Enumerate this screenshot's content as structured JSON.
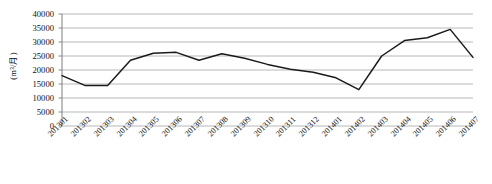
{
  "chart_data": {
    "type": "line",
    "title": "",
    "xlabel": "",
    "ylabel": "(m³/月)",
    "ylim": [
      0,
      40000
    ],
    "ytick_step": 5000,
    "grid": true,
    "legend": "none",
    "line_color": "#1a1a1a",
    "grid_color": "#a6a6a6",
    "axis_color": "#7f7f7f",
    "categories": [
      "201301",
      "201302",
      "201303",
      "201304",
      "201305",
      "201306",
      "201307",
      "201308",
      "201309",
      "201310",
      "201311",
      "201312",
      "201401",
      "201402",
      "201403",
      "201404",
      "201405",
      "201406",
      "201407"
    ],
    "values": [
      18000,
      14500,
      14500,
      23500,
      26000,
      26300,
      23500,
      25800,
      24200,
      22000,
      20300,
      19200,
      17200,
      13000,
      25000,
      30500,
      31500,
      34500,
      24500
    ],
    "yticks": [
      "40000",
      "35000",
      "30000",
      "25000",
      "20000",
      "15000",
      "10000",
      "5000",
      "0"
    ],
    "ytick_values": [
      40000,
      35000,
      30000,
      25000,
      20000,
      15000,
      10000,
      5000,
      0
    ]
  }
}
